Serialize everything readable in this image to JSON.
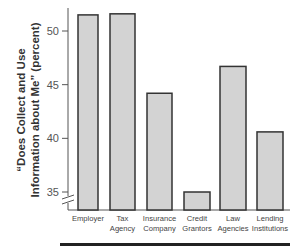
{
  "chart_data": {
    "type": "bar",
    "title": "",
    "xlabel": "",
    "ylabel": "“Does Collect and Use Information about Me” (percent)",
    "ylabel_lines": [
      "“Does Collect and Use",
      "Information about Me” (percent)"
    ],
    "categories": [
      "Employer",
      "Tax Agency",
      "Insurance Company",
      "Credit Grantors",
      "Law Agencies",
      "Lending Institutions"
    ],
    "category_lines": [
      [
        "Employer"
      ],
      [
        "Tax",
        "Agency"
      ],
      [
        "Insurance",
        "Company"
      ],
      [
        "Credit",
        "Grantors"
      ],
      [
        "Law",
        "Agencies"
      ],
      [
        "Lending",
        "Institutions"
      ]
    ],
    "values": [
      51.5,
      51.6,
      44.2,
      35.0,
      46.7,
      40.6
    ],
    "ylim": [
      34,
      52
    ],
    "yticks": [
      35,
      40,
      45,
      50
    ],
    "axis_break": true,
    "grid": false,
    "legend": null,
    "bar_fill": "#d3d3d3",
    "bar_stroke": "#333333"
  }
}
